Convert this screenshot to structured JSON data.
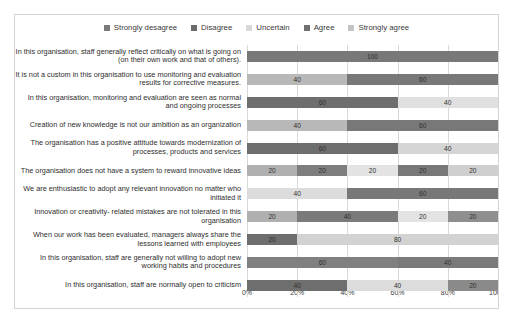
{
  "chart_data": {
    "type": "bar",
    "subtype": "100% stacked horizontal bar",
    "title": "",
    "xlabel": "",
    "ylabel": "",
    "xlim": [
      0,
      100
    ],
    "xticks": [
      "0%",
      "20%",
      "40%",
      "60%",
      "80%",
      "100%"
    ],
    "xtick_values": [
      0,
      20,
      40,
      60,
      80,
      100
    ],
    "grid": true,
    "legend_position": "top",
    "orientation": "horizontal",
    "legend": [
      {
        "label": "Strongly desagree",
        "color": "#7a7a7a"
      },
      {
        "label": "Disagree",
        "color": "#6b6b6b"
      },
      {
        "label": "Uncertain",
        "color": "#d9d9d9"
      },
      {
        "label": "Agree",
        "color": "#707070"
      },
      {
        "label": "Strongly agree",
        "color": "#c4c4c4"
      }
    ],
    "series_names": [
      "Strongly desagree",
      "Disagree",
      "Uncertain",
      "Agree",
      "Strongly agree"
    ],
    "categories": [
      "In this organisation, staff generally reflect critically on what is going on (on their own work and that of others).",
      "It is not a custom in this organisation to use monitoring and evaluation results for corrective measures.",
      "In this organisation, monitoring and evaluation are seen as normal and ongoing processes",
      "Creation of new knowledge is not our ambition as an organization",
      "The organisation has a positive attitude towards modernization of processes, products and services",
      "The organisation does not have a system to reward innovative ideas",
      "We are enthusiastic to adopt any relevant innovation no matter who initiated it",
      "Innovation or creativity- related mistakes are not tolerated in this organisation",
      "When our work has been evaluated, managers always share the lessons learned with employees",
      "In this organisation, staff are generally not willing to adopt new working habits and procedures",
      "In this organisation, staff are normally open to criticism"
    ],
    "rows": [
      {
        "segments": [
          {
            "series": "Agree",
            "value": 100,
            "label": "100",
            "color": "#787878"
          }
        ]
      },
      {
        "segments": [
          {
            "series": "Uncertain",
            "value": 40,
            "label": "40",
            "color": "#b8b8b8"
          },
          {
            "series": "Agree",
            "value": 60,
            "label": "60",
            "color": "#787878"
          }
        ]
      },
      {
        "segments": [
          {
            "series": "Disagree",
            "value": 60,
            "label": "60",
            "color": "#6e6e6e"
          },
          {
            "series": "Strongly agree",
            "value": 40,
            "label": "40",
            "color": "#e0e0e0"
          }
        ]
      },
      {
        "segments": [
          {
            "series": "Uncertain",
            "value": 40,
            "label": "40",
            "color": "#b8b8b8"
          },
          {
            "series": "Agree",
            "value": 60,
            "label": "60",
            "color": "#787878"
          }
        ]
      },
      {
        "segments": [
          {
            "series": "Disagree",
            "value": 60,
            "label": "60",
            "color": "#6e6e6e"
          },
          {
            "series": "Strongly agree",
            "value": 40,
            "label": "40",
            "color": "#d5d5d5"
          }
        ]
      },
      {
        "segments": [
          {
            "series": "Strongly desagree",
            "value": 20,
            "label": "20",
            "color": "#b0b0b0"
          },
          {
            "series": "Disagree",
            "value": 20,
            "label": "20",
            "color": "#7d7d7d"
          },
          {
            "series": "Uncertain",
            "value": 20,
            "label": "20",
            "color": "#e3e3e3"
          },
          {
            "series": "Agree",
            "value": 20,
            "label": "20",
            "color": "#787878"
          },
          {
            "series": "Strongly agree",
            "value": 20,
            "label": "20",
            "color": "#cfcfcf"
          }
        ]
      },
      {
        "segments": [
          {
            "series": "Uncertain",
            "value": 40,
            "label": "40",
            "color": "#dcdcdc"
          },
          {
            "series": "Agree",
            "value": 60,
            "label": "60",
            "color": "#787878"
          }
        ]
      },
      {
        "segments": [
          {
            "series": "Strongly desagree",
            "value": 20,
            "label": "20",
            "color": "#b0b0b0"
          },
          {
            "series": "Agree",
            "value": 40,
            "label": "40",
            "color": "#7a7a7a"
          },
          {
            "series": "Uncertain",
            "value": 20,
            "label": "20",
            "color": "#e3e3e3"
          },
          {
            "series": "Strongly agree",
            "value": 20,
            "label": "20",
            "color": "#8f8f8f"
          }
        ]
      },
      {
        "segments": [
          {
            "series": "Disagree",
            "value": 20,
            "label": "20",
            "color": "#6e6e6e"
          },
          {
            "series": "Strongly agree",
            "value": 80,
            "label": "80",
            "color": "#d2d2d2"
          }
        ]
      },
      {
        "segments": [
          {
            "series": "Agree",
            "value": 60,
            "label": "60",
            "color": "#808080"
          },
          {
            "series": "Agree",
            "value": 40,
            "label": "40",
            "color": "#7a7a7a"
          }
        ]
      },
      {
        "segments": [
          {
            "series": "Disagree",
            "value": 40,
            "label": "40",
            "color": "#6e6e6e"
          },
          {
            "series": "Uncertain",
            "value": 40,
            "label": "40",
            "color": "#dcdcdc"
          },
          {
            "series": "Agree",
            "value": 20,
            "label": "20",
            "color": "#8a8a8a"
          }
        ]
      }
    ]
  }
}
